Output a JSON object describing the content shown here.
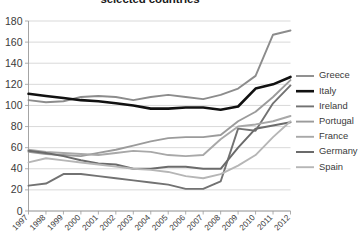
{
  "chart_data": {
    "type": "line",
    "title": "selected countries",
    "xlabel": "",
    "ylabel": "",
    "ylim": [
      0,
      180
    ],
    "ytick_step": 20,
    "grid": true,
    "legend_position": "right",
    "x": [
      "1997",
      "1998",
      "1999",
      "2000",
      "2001",
      "2002",
      "2003",
      "2004",
      "2005",
      "2006",
      "2007",
      "2008",
      "2009",
      "2010",
      "2011",
      "2012"
    ],
    "ytick_labels": [
      "180",
      "160",
      "140",
      "120",
      "100",
      "80",
      "60",
      "40",
      "20",
      "0"
    ],
    "series": [
      {
        "name": "Greece",
        "color": "#8c8c8c",
        "width": 1.9,
        "values": [
          105,
          103,
          104,
          108,
          109,
          108,
          105,
          108,
          110,
          108,
          106,
          110,
          116,
          128,
          167,
          171
        ]
      },
      {
        "name": "Italy",
        "color": "#111111",
        "width": 2.6,
        "values": [
          111,
          109,
          107,
          105,
          104,
          102,
          100,
          97,
          97,
          98,
          98,
          96,
          99,
          116,
          120,
          127
        ]
      },
      {
        "name": "Ireland",
        "color": "#727272",
        "width": 1.9,
        "values": [
          24,
          26,
          35,
          35,
          33,
          31,
          29,
          27,
          25,
          21,
          21,
          28,
          78,
          76,
          102,
          119
        ]
      },
      {
        "name": "Portugal",
        "color": "#9b9b9b",
        "width": 1.9,
        "values": [
          56,
          54,
          53,
          52,
          55,
          58,
          62,
          66,
          69,
          70,
          70,
          72,
          85,
          94,
          108,
          124
        ]
      },
      {
        "name": "France",
        "color": "#a8a8a8",
        "width": 1.9,
        "values": [
          58,
          56,
          55,
          54,
          53,
          55,
          57,
          56,
          53,
          52,
          53,
          68,
          80,
          82,
          85,
          90
        ]
      },
      {
        "name": "Germany",
        "color": "#6b6b6b",
        "width": 2.0,
        "values": [
          57,
          55,
          52,
          48,
          45,
          44,
          40,
          40,
          42,
          42,
          40,
          40,
          60,
          78,
          81,
          84
        ]
      },
      {
        "name": "Spain",
        "color": "#b6b6b6",
        "width": 1.9,
        "values": [
          46,
          50,
          48,
          46,
          44,
          42,
          40,
          39,
          37,
          33,
          31,
          35,
          43,
          53,
          70,
          85
        ]
      }
    ]
  },
  "legend": {
    "items": [
      {
        "label": "Greece"
      },
      {
        "label": "Italy"
      },
      {
        "label": "Ireland"
      },
      {
        "label": "Portugal"
      },
      {
        "label": "France"
      },
      {
        "label": "Germany"
      },
      {
        "label": "Spain"
      }
    ]
  }
}
